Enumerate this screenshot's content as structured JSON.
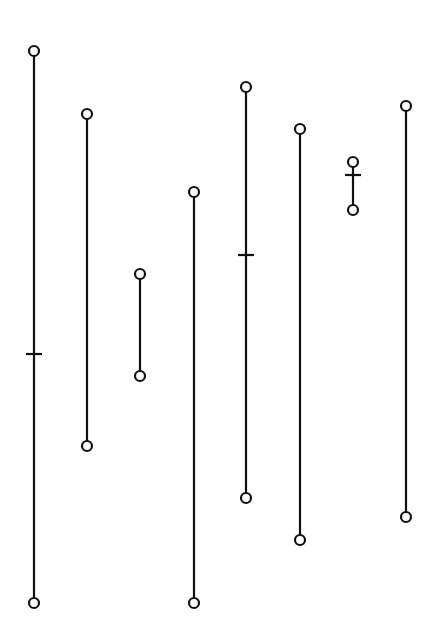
{
  "diagram": {
    "width": 438,
    "height": 633,
    "background": "#ffffff",
    "stroke_color": "#111111",
    "line_width": 2.2,
    "node_radius": 5,
    "tick_half_width": 8,
    "segments": [
      {
        "x": 34,
        "y_top": 51,
        "y_bottom": 603,
        "ticks": [
          354
        ]
      },
      {
        "x": 87,
        "y_top": 114,
        "y_bottom": 446,
        "ticks": []
      },
      {
        "x": 140,
        "y_top": 274,
        "y_bottom": 376,
        "ticks": []
      },
      {
        "x": 194,
        "y_top": 192,
        "y_bottom": 603,
        "ticks": []
      },
      {
        "x": 246,
        "y_top": 87,
        "y_bottom": 498,
        "ticks": [
          255
        ]
      },
      {
        "x": 300,
        "y_top": 129,
        "y_bottom": 540,
        "ticks": []
      },
      {
        "x": 353,
        "y_top": 162,
        "y_bottom": 210,
        "ticks": [
          175
        ]
      },
      {
        "x": 406,
        "y_top": 106,
        "y_bottom": 517,
        "ticks": []
      }
    ]
  }
}
